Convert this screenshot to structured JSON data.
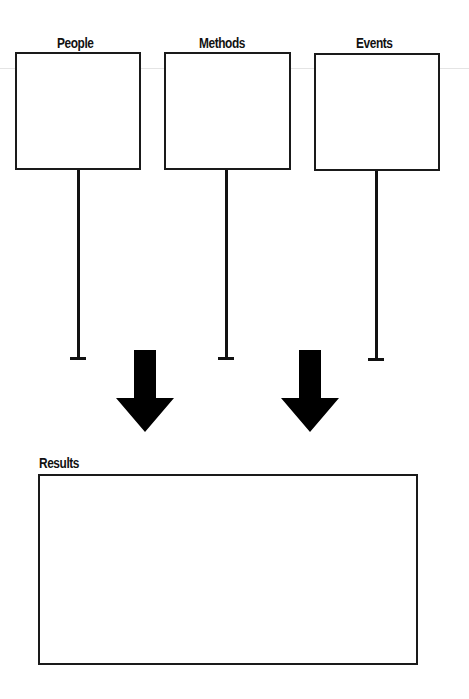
{
  "diagram": {
    "inputs": [
      {
        "label": "People"
      },
      {
        "label": "Methods"
      },
      {
        "label": "Events"
      }
    ],
    "output": {
      "label": "Results"
    },
    "arrow_icon": "down-arrow-icon",
    "colors": {
      "stroke": "#1a1a1a",
      "background": "#ffffff"
    }
  }
}
